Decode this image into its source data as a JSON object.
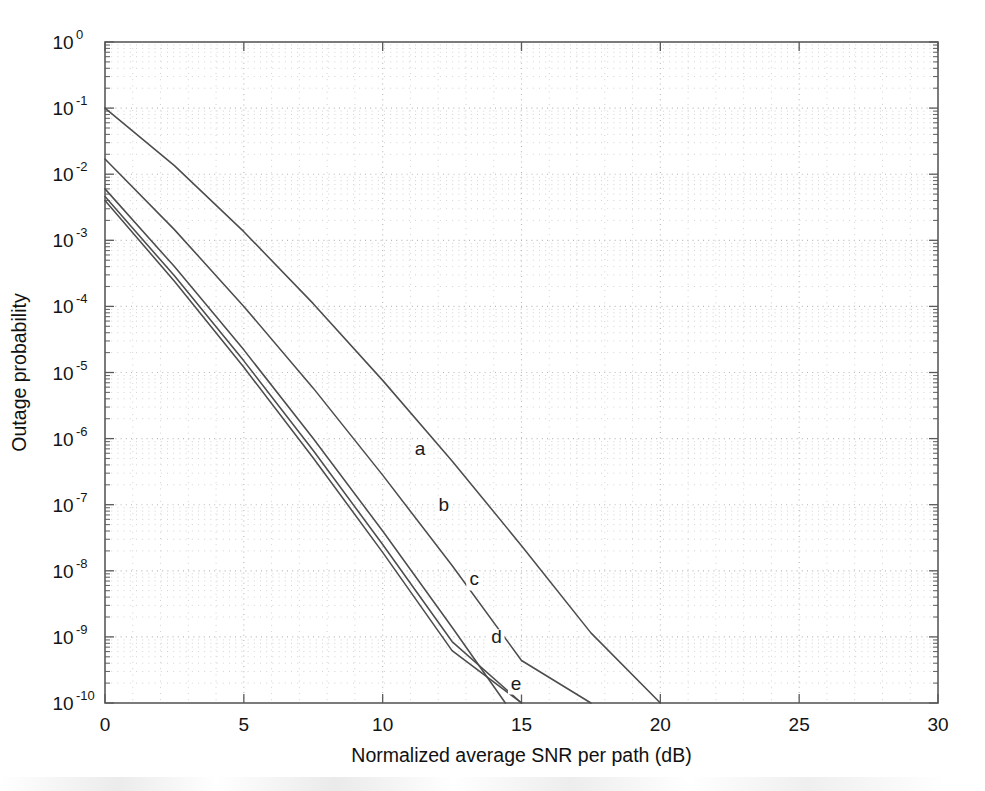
{
  "figure": {
    "background_color": "#ffffff",
    "width": 985,
    "height": 791
  },
  "chart_data": {
    "type": "line",
    "title": "",
    "xlabel": "Normalized average SNR per path (dB)",
    "ylabel": "Outage probability",
    "xlim": [
      0,
      30
    ],
    "ylim": [
      1e-10,
      1
    ],
    "yscale": "log",
    "xscale": "linear",
    "xticks": [
      0,
      5,
      10,
      15,
      20,
      25,
      30
    ],
    "xtick_labels": [
      "0",
      "5",
      "10",
      "15",
      "20",
      "25",
      "30"
    ],
    "yticks": [
      1,
      0.1,
      0.01,
      0.001,
      0.0001,
      1e-05,
      1e-06,
      1e-07,
      1e-08,
      1e-09,
      1e-10
    ],
    "ytick_labels": [
      "10^0",
      "10^-1",
      "10^-2",
      "10^-3",
      "10^-4",
      "10^-5",
      "10^-6",
      "10^-7",
      "10^-8",
      "10^-9",
      "10^-10"
    ],
    "ytick_mantissa": [
      "10",
      "10",
      "10",
      "10",
      "10",
      "10",
      "10",
      "10",
      "10",
      "10",
      "10"
    ],
    "ytick_exponents": [
      "0",
      "-1",
      "-2",
      "-3",
      "-4",
      "-5",
      "-6",
      "-7",
      "-8",
      "-9",
      "-10"
    ],
    "grid": true,
    "grid_style": "dotted",
    "grid_minor": true,
    "legend": "inline-curve-labels",
    "legend_position": "inline",
    "line_color": "#4d4d4d",
    "series": [
      {
        "name": "a",
        "label": "a",
        "label_x": 11.35,
        "label_y": 5.6e-07,
        "x": [
          0,
          2.5,
          5,
          7.5,
          10,
          12.5,
          15,
          17.5,
          20
        ],
        "y": [
          0.1,
          0.0135,
          0.00135,
          0.00011,
          7.6e-06,
          4.6e-07,
          2.4e-08,
          1.15e-09,
          1e-10
        ]
      },
      {
        "name": "b",
        "label": "b",
        "label_x": 12.2,
        "label_y": 8e-08,
        "x": [
          0,
          2.5,
          5,
          7.5,
          10,
          12.5,
          15,
          17.5
        ],
        "y": [
          0.017,
          0.00145,
          0.0001,
          5.8e-06,
          2.8e-07,
          1.2e-08,
          4.4e-10,
          1e-10
        ]
      },
      {
        "name": "c",
        "label": "c",
        "label_x": 13.3,
        "label_y": 6e-09,
        "x": [
          0,
          2.5,
          5,
          7.5,
          10,
          12.5,
          15,
          16.6
        ],
        "y": [
          0.006,
          0.0004,
          2.2e-05,
          1e-06,
          4e-08,
          1.4e-09,
          4.5e-11,
          1e-10
        ]
      },
      {
        "name": "d",
        "label": "d",
        "label_x": 14.1,
        "label_y": 8e-10,
        "x": [
          0,
          2.5,
          5,
          7.5,
          10,
          12.5,
          15,
          16.0
        ],
        "y": [
          0.0046,
          0.00029,
          1.5e-05,
          6.6e-07,
          2.5e-08,
          8.5e-10,
          1e-10,
          1e-10
        ]
      },
      {
        "name": "e",
        "label": "e",
        "label_x": 14.8,
        "label_y": 1.6e-10,
        "x": [
          0,
          2.5,
          5,
          7.5,
          10,
          12.5,
          15,
          15.6
        ],
        "y": [
          0.004,
          0.00024,
          1.2e-05,
          5.1e-07,
          1.9e-08,
          6.2e-10,
          1e-10,
          1e-10
        ]
      }
    ]
  }
}
